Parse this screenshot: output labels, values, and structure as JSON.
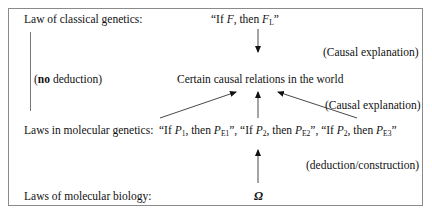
{
  "diagram": {
    "labels": {
      "classical_law": "Law of classical genetics:",
      "no_deduction_bold": "no",
      "no_deduction_rest": " deduction)",
      "no_deduction_open": "(",
      "causal_relations": "Certain causal relations in the world",
      "causal_explanation_top": "(Causal explanation)",
      "causal_explanation_mid": "(Causal explanation)",
      "molecular_genetics": "Laws in molecular genetics:",
      "deduction_construction": "(deduction/construction)",
      "molecular_biology": "Laws of molecular biology:",
      "omega": "Ω"
    },
    "classical_formula": {
      "open": "“If ",
      "F": "F",
      "mid": ", then ",
      "FL": "F",
      "FL_sub": "L",
      "close": "”"
    },
    "molecular_formulas": [
      {
        "open": "“If ",
        "P": "P",
        "P_sub": "1",
        "mid": ", then ",
        "PE": "P",
        "PE_sub": "E1",
        "close": "”, "
      },
      {
        "open": "“If ",
        "P": "P",
        "P_sub": "2",
        "mid": ", then ",
        "PE": "P",
        "PE_sub": "E2",
        "close": "”, "
      },
      {
        "open": "“If ",
        "P": "P",
        "P_sub": "2",
        "mid": ", then ",
        "PE": "P",
        "PE_sub": "E3",
        "close": "”"
      }
    ],
    "arrows": [
      {
        "from": "classical-law",
        "to": "causal-relations",
        "direction": "down"
      },
      {
        "from": "molecular-law-1",
        "to": "causal-relations",
        "direction": "up-right"
      },
      {
        "from": "molecular-law-2",
        "to": "causal-relations",
        "direction": "up"
      },
      {
        "from": "molecular-law-3",
        "to": "causal-relations",
        "direction": "up-left"
      },
      {
        "from": "omega",
        "to": "molecular-laws",
        "direction": "up"
      }
    ]
  }
}
